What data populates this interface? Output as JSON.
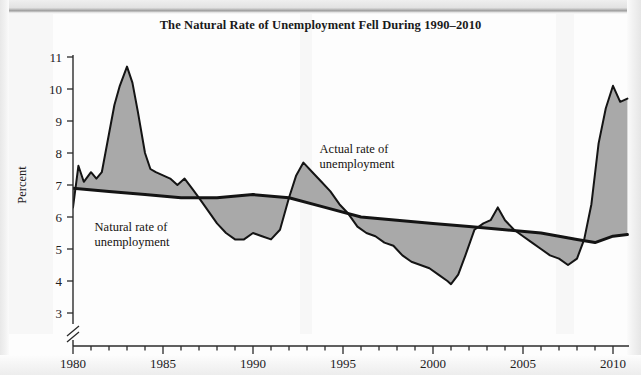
{
  "figure": {
    "title": "The Natural Rate of Unemployment Fell During 1990–2010",
    "background_color": "#fdfdfd",
    "fill_color": "#a9a9a9",
    "line_color": "#141414",
    "axis_color": "#2b2b2b"
  },
  "annotations": {
    "actual": {
      "line1": "Actual rate of",
      "line2": "unemployment"
    },
    "natural": {
      "line1": "Natural rate of",
      "line2": "unemployment"
    }
  },
  "chart_data": {
    "type": "line",
    "title": "The Natural Rate of Unemployment Fell During 1990–2010",
    "subtitle": "",
    "xlabel": "",
    "ylabel": "Percent",
    "xlim": [
      1980,
      2010.8
    ],
    "ylim": [
      3,
      11
    ],
    "yticks": [
      3,
      4,
      5,
      6,
      7,
      8,
      9,
      10,
      11
    ],
    "ytick_labels": [
      "3",
      "4",
      "5",
      "6",
      "7",
      "8",
      "9",
      "10",
      "11"
    ],
    "xticks": [
      1980,
      1985,
      1990,
      1995,
      2000,
      2005,
      2010
    ],
    "xtick_labels": [
      "1980",
      "1985",
      "1990",
      "1995",
      "2000",
      "2005",
      "2010"
    ],
    "x_minor_tick_step": 1,
    "y_axis_break": true,
    "y_axis_break_below": 3,
    "grid": false,
    "legend": "none",
    "fill_between_series": [
      "Actual rate of unemployment",
      "Natural rate of unemployment"
    ],
    "fill_color": "#a9a9a9",
    "series": [
      {
        "name": "Actual rate of unemployment",
        "color": "#141414",
        "x": [
          1980.0,
          1980.3,
          1980.6,
          1981.0,
          1981.3,
          1981.6,
          1982.0,
          1982.3,
          1982.6,
          1983.0,
          1983.3,
          1983.6,
          1984.0,
          1984.3,
          1984.6,
          1985.0,
          1985.4,
          1985.8,
          1986.2,
          1986.6,
          1987.0,
          1987.5,
          1988.0,
          1988.5,
          1989.0,
          1989.5,
          1990.0,
          1990.5,
          1991.0,
          1991.5,
          1992.0,
          1992.4,
          1992.8,
          1993.3,
          1993.8,
          1994.3,
          1994.8,
          1995.3,
          1995.8,
          1996.3,
          1996.8,
          1997.3,
          1997.8,
          1998.3,
          1998.8,
          1999.3,
          1999.8,
          2000.3,
          2000.8,
          2001.0,
          2001.4,
          2001.8,
          2002.3,
          2002.8,
          2003.2,
          2003.6,
          2004.0,
          2004.5,
          2005.0,
          2005.5,
          2006.0,
          2006.5,
          2007.0,
          2007.5,
          2008.0,
          2008.4,
          2008.8,
          2009.2,
          2009.6,
          2010.0,
          2010.4,
          2010.8
        ],
        "y": [
          6.3,
          7.6,
          7.1,
          7.4,
          7.2,
          7.4,
          8.6,
          9.5,
          10.1,
          10.7,
          10.2,
          9.3,
          8.0,
          7.5,
          7.4,
          7.3,
          7.2,
          7.0,
          7.2,
          6.9,
          6.6,
          6.2,
          5.8,
          5.5,
          5.3,
          5.3,
          5.5,
          5.4,
          5.3,
          5.6,
          6.6,
          7.3,
          7.7,
          7.4,
          7.1,
          6.8,
          6.4,
          6.1,
          5.7,
          5.5,
          5.4,
          5.2,
          5.1,
          4.8,
          4.6,
          4.5,
          4.4,
          4.2,
          4.0,
          3.9,
          4.2,
          4.8,
          5.6,
          5.8,
          5.9,
          6.3,
          5.9,
          5.6,
          5.4,
          5.2,
          5.0,
          4.8,
          4.7,
          4.5,
          4.7,
          5.3,
          6.4,
          8.3,
          9.4,
          10.1,
          9.6,
          9.7
        ]
      },
      {
        "name": "Natural rate of unemployment",
        "color": "#141414",
        "x": [
          1980,
          1982,
          1984,
          1986,
          1988,
          1990,
          1992,
          1994,
          1996,
          1998,
          2000,
          2002,
          2004,
          2006,
          2008,
          2009,
          2010,
          2010.8
        ],
        "y": [
          6.9,
          6.8,
          6.7,
          6.6,
          6.6,
          6.7,
          6.6,
          6.3,
          6.0,
          5.9,
          5.8,
          5.7,
          5.6,
          5.5,
          5.3,
          5.2,
          5.4,
          5.45
        ]
      }
    ],
    "annotations": [
      {
        "text": "Actual rate of unemployment",
        "x": 1993.7,
        "y": 8.0
      },
      {
        "text": "Natural rate of unemployment",
        "x": 1981.2,
        "y": 5.55
      }
    ],
    "key_points": {
      "actual_peak_1983": 10.7,
      "actual_trough_1989": 5.3,
      "actual_peak_1992": 7.7,
      "actual_trough_2000": 3.9,
      "actual_peak_2003": 6.3,
      "actual_trough_2006": 4.5,
      "actual_peak_2009": 10.1,
      "natural_start_1980": 6.9,
      "natural_end_2010": 5.4
    }
  }
}
